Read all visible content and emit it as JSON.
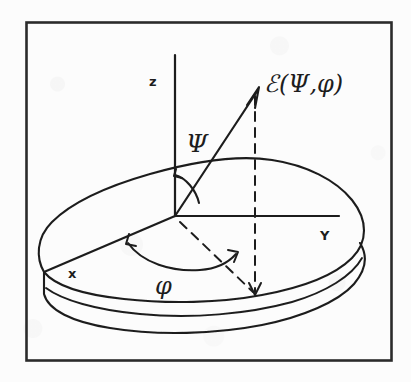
{
  "figure": {
    "kind": "hand-drawn-scientific-diagram",
    "ink_color": "#1d1d1d",
    "paper_color": "#fcfcfc",
    "frame": {
      "name": "figure-border",
      "x": 26,
      "y": 22,
      "width": 366,
      "height": 339
    },
    "labels": {
      "z_axis": "z",
      "y_axis": "Y",
      "x_axis": "x",
      "polar_angle": "Ψ",
      "azimuth_angle": "φ",
      "field_vector": "ℰ(Ψ,φ)"
    },
    "elements": {
      "slab_name": "irregular-slab-outline",
      "z_axis_name": "z-axis",
      "y_axis_name": "y-axis",
      "x_axis_name": "x-axis",
      "vector_name": "field-vector-arrow",
      "psi_arc_name": "psi-angle-arc",
      "phi_arc_name": "phi-angle-arc",
      "vertical_projection_name": "vertical-projection-dashed",
      "ground_projection_name": "ground-projection-dashed"
    },
    "geometry": {
      "origin": [
        175,
        216
      ],
      "z_top": [
        175,
        55
      ],
      "y_end": [
        339,
        216
      ],
      "x_end": [
        44,
        272
      ],
      "vector_tip": [
        258,
        88
      ],
      "projection_foot": [
        255,
        296
      ]
    }
  }
}
